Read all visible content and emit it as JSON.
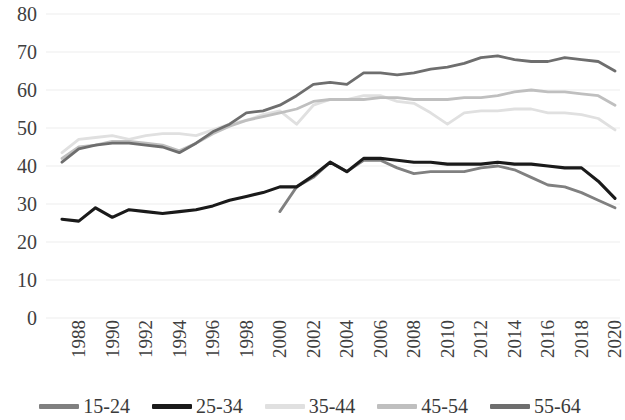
{
  "chart_data": {
    "type": "line",
    "title": "",
    "subtitle": "",
    "xlabel": "",
    "ylabel": "",
    "xlim": [
      1988,
      2021
    ],
    "ylim": [
      0,
      80
    ],
    "ytick_values": [
      0,
      10,
      20,
      30,
      40,
      50,
      60,
      70,
      80
    ],
    "ytick_labels": [
      "0",
      "10",
      "20",
      "30",
      "40",
      "50",
      "60",
      "70",
      "80"
    ],
    "xtick_values": [
      1988,
      1990,
      1992,
      1994,
      1996,
      1998,
      2000,
      2002,
      2004,
      2006,
      2008,
      2010,
      2012,
      2014,
      2016,
      2018,
      2020
    ],
    "xtick_labels": [
      "1988",
      "1990",
      "1992",
      "1994",
      "1996",
      "1998",
      "2000",
      "2002",
      "2004",
      "2006",
      "2008",
      "2010",
      "2012",
      "2014",
      "2016",
      "2018",
      "2020"
    ],
    "grid": true,
    "grid_axis": "y",
    "legend_position": "bottom",
    "series": [
      {
        "name": "15-24",
        "color": "#808080",
        "x": [
          2001,
          2002,
          2003,
          2004,
          2005,
          2006,
          2007,
          2008,
          2009,
          2010,
          2011,
          2012,
          2013,
          2014,
          2015,
          2016,
          2017,
          2018,
          2019,
          2020,
          2021
        ],
        "values": [
          28.0,
          34.5,
          37.0,
          41.0,
          38.5,
          41.5,
          41.5,
          39.5,
          38.0,
          38.5,
          38.5,
          38.5,
          39.5,
          40.0,
          39.0,
          37.0,
          35.0,
          34.5,
          33.0,
          31.0,
          29.0
        ]
      },
      {
        "name": "25-34",
        "color": "#1a1a1a",
        "x": [
          1988,
          1989,
          1990,
          1991,
          1992,
          1993,
          1994,
          1995,
          1996,
          1997,
          1998,
          1999,
          2000,
          2001,
          2002,
          2003,
          2004,
          2005,
          2006,
          2007,
          2008,
          2009,
          2010,
          2011,
          2012,
          2013,
          2014,
          2015,
          2016,
          2017,
          2018,
          2019,
          2020,
          2021
        ],
        "values": [
          26.0,
          25.5,
          29.0,
          26.5,
          28.5,
          28.0,
          27.5,
          28.0,
          28.5,
          29.5,
          31.0,
          32.0,
          33.0,
          34.5,
          34.5,
          37.5,
          41.0,
          38.5,
          42.0,
          42.0,
          41.5,
          41.0,
          41.0,
          40.5,
          40.5,
          40.5,
          41.0,
          40.5,
          40.5,
          40.0,
          39.5,
          39.5,
          36.0,
          31.5
        ]
      },
      {
        "name": "35-44",
        "color": "#e0e0e0",
        "x": [
          1988,
          1989,
          1990,
          1991,
          1992,
          1993,
          1994,
          1995,
          1996,
          1997,
          1998,
          1999,
          2000,
          2001,
          2002,
          2003,
          2004,
          2005,
          2006,
          2007,
          2008,
          2009,
          2010,
          2011,
          2012,
          2013,
          2014,
          2015,
          2016,
          2017,
          2018,
          2019,
          2020,
          2021
        ],
        "values": [
          43.5,
          47.0,
          47.5,
          48.0,
          47.0,
          48.0,
          48.5,
          48.5,
          48.0,
          49.5,
          51.0,
          52.0,
          53.5,
          54.5,
          51.0,
          56.0,
          57.5,
          57.5,
          58.5,
          58.5,
          57.0,
          56.5,
          54.0,
          51.0,
          54.0,
          54.5,
          54.5,
          55.0,
          55.0,
          54.0,
          54.0,
          53.5,
          52.5,
          49.5
        ]
      },
      {
        "name": "45-54",
        "color": "#bfbfbf",
        "x": [
          1988,
          1989,
          1990,
          1991,
          1992,
          1993,
          1994,
          1995,
          1996,
          1997,
          1998,
          1999,
          2000,
          2001,
          2002,
          2003,
          2004,
          2005,
          2006,
          2007,
          2008,
          2009,
          2010,
          2011,
          2012,
          2013,
          2014,
          2015,
          2016,
          2017,
          2018,
          2019,
          2020,
          2021
        ],
        "values": [
          42.0,
          45.0,
          45.5,
          46.5,
          46.5,
          46.0,
          45.5,
          44.0,
          46.0,
          48.5,
          50.5,
          52.0,
          53.0,
          54.0,
          55.0,
          57.0,
          57.5,
          57.5,
          57.5,
          58.0,
          58.0,
          57.5,
          57.5,
          57.5,
          58.0,
          58.0,
          58.5,
          59.5,
          60.0,
          59.5,
          59.5,
          59.0,
          58.5,
          56.0
        ]
      },
      {
        "name": "55-64",
        "color": "#6e6e6e",
        "x": [
          1988,
          1989,
          1990,
          1991,
          1992,
          1993,
          1994,
          1995,
          1996,
          1997,
          1998,
          1999,
          2000,
          2001,
          2002,
          2003,
          2004,
          2005,
          2006,
          2007,
          2008,
          2009,
          2010,
          2011,
          2012,
          2013,
          2014,
          2015,
          2016,
          2017,
          2018,
          2019,
          2020,
          2021
        ],
        "values": [
          41.0,
          44.5,
          45.5,
          46.0,
          46.0,
          45.5,
          45.0,
          43.5,
          46.0,
          49.0,
          51.0,
          54.0,
          54.5,
          56.0,
          58.5,
          61.5,
          62.0,
          61.5,
          64.5,
          64.5,
          64.0,
          64.5,
          65.5,
          66.0,
          67.0,
          68.5,
          69.0,
          68.0,
          67.5,
          67.5,
          68.5,
          68.0,
          67.5,
          65.0
        ]
      }
    ]
  },
  "axes": {
    "y_ticks": [
      "0",
      "10",
      "20",
      "30",
      "40",
      "50",
      "60",
      "70",
      "80"
    ],
    "x_ticks": [
      "1988",
      "1990",
      "1992",
      "1994",
      "1996",
      "1998",
      "2000",
      "2002",
      "2004",
      "2006",
      "2008",
      "2010",
      "2012",
      "2014",
      "2016",
      "2018",
      "2020"
    ]
  },
  "legend": {
    "items": [
      {
        "label": "15-24",
        "color": "#808080"
      },
      {
        "label": "25-34",
        "color": "#1a1a1a"
      },
      {
        "label": "35-44",
        "color": "#e0e0e0"
      },
      {
        "label": "45-54",
        "color": "#bfbfbf"
      },
      {
        "label": "55-64",
        "color": "#6e6e6e"
      }
    ]
  },
  "style": {
    "grid_color": "#ededed",
    "text_color": "#3a3a3a",
    "background": "#ffffff"
  }
}
